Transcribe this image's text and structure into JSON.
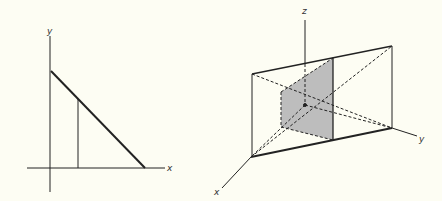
{
  "left_figure": {
    "labels": {
      "x": "x",
      "y": "y"
    },
    "description": "2D axes with a line segment from y-intercept to x-intercept and a vertical line under it"
  },
  "right_figure": {
    "labels": {
      "x": "x",
      "y": "y",
      "z": "z"
    },
    "description": "3D axes with a rectangular box (parallelepiped) face and a shaded cross-section rectangle",
    "shade_color": "#bdbdbd",
    "line_color": "#222222"
  }
}
